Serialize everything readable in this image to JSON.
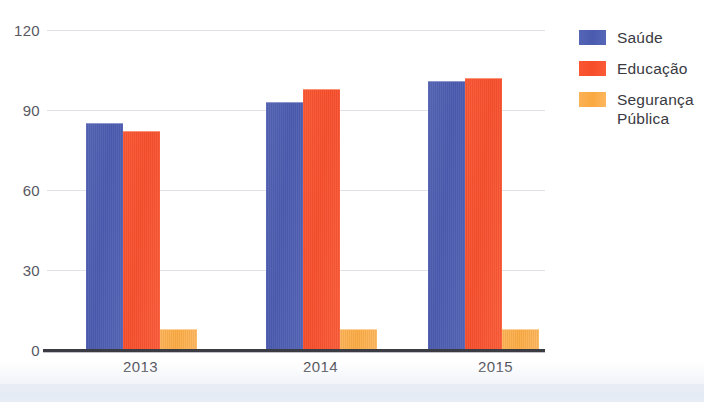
{
  "chart_data": {
    "type": "bar",
    "title": "",
    "subtitle": "",
    "xlabel": "",
    "ylabel": "",
    "categories": [
      "2013",
      "2014",
      "2015"
    ],
    "series": [
      {
        "name": "Saúde",
        "color": "#4f5fb0",
        "values": [
          85,
          93,
          101
        ]
      },
      {
        "name": "Educação",
        "color": "#f9512f",
        "values": [
          82,
          98,
          102
        ]
      },
      {
        "name": "Segurança\nPública",
        "color": "#fbaf4d",
        "values": [
          8,
          8,
          8
        ]
      }
    ],
    "ylim": [
      0,
      120
    ],
    "yticks": [
      "0",
      "30",
      "60",
      "90",
      "120"
    ],
    "ytick_values": [
      0,
      30,
      60,
      90,
      120
    ],
    "grid": true,
    "legend_position": "right"
  },
  "legend": {
    "entries": [
      {
        "label": "Saúde"
      },
      {
        "label": "Educação"
      },
      {
        "label": "Segurança\nPública"
      }
    ]
  },
  "axes": {
    "y_tick_labels": [
      "120",
      "90",
      "60",
      "30",
      "0"
    ],
    "x_tick_labels": [
      "2013",
      "2014",
      "2015"
    ]
  }
}
